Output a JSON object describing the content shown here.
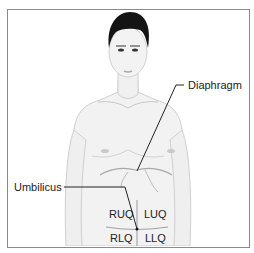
{
  "figure": {
    "labels": {
      "diaphragm": "Diaphragm",
      "umbilicus": "Umbilicus"
    },
    "quadrants": {
      "ruq": "RUQ",
      "luq": "LUQ",
      "rlq": "RLQ",
      "llq": "LLQ"
    }
  },
  "colors": {
    "skin": "#f0f0f0",
    "outline": "#c8c8c8",
    "hair": "#1a1a1a",
    "border": "#8a8a8a",
    "leader": "#222222"
  }
}
